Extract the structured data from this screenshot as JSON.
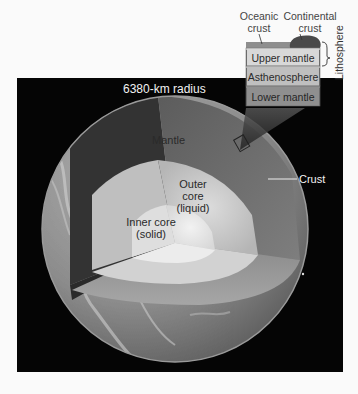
{
  "figure": {
    "radius_label": "6380-km radius",
    "layers": {
      "mantle": "Mantle",
      "outer_core_line1": "Outer",
      "outer_core_line2": "core",
      "outer_core_line3": "(liquid)",
      "inner_core_line1": "Inner core",
      "inner_core_line2": "(solid)",
      "crust": "Crust"
    },
    "inset": {
      "oceanic_crust_line1": "Oceanic",
      "oceanic_crust_line2": "crust",
      "continental_crust_line1": "Continental",
      "continental_crust_line2": "crust",
      "upper_mantle": "Upper mantle",
      "asthenosphere": "Asthenosphere",
      "lower_mantle": "Lower mantle",
      "lithosphere": "Lithosphere"
    },
    "colors": {
      "background": "#fafafa",
      "space": "#050505",
      "crust_surface": "#8a8a8a",
      "mantle_dark": "#3a3a3a",
      "mantle_light": "#7a7a7a",
      "outer_core": "#c9c9c9",
      "inner_core": "#e6e6e6",
      "oceanic_crust": "#8e8e8e",
      "continental_crust": "#4a4a4a",
      "upper_mantle": "#d8d8d8",
      "asthenosphere": "#bdbdbd",
      "lower_mantle": "#8f8f8f"
    }
  }
}
